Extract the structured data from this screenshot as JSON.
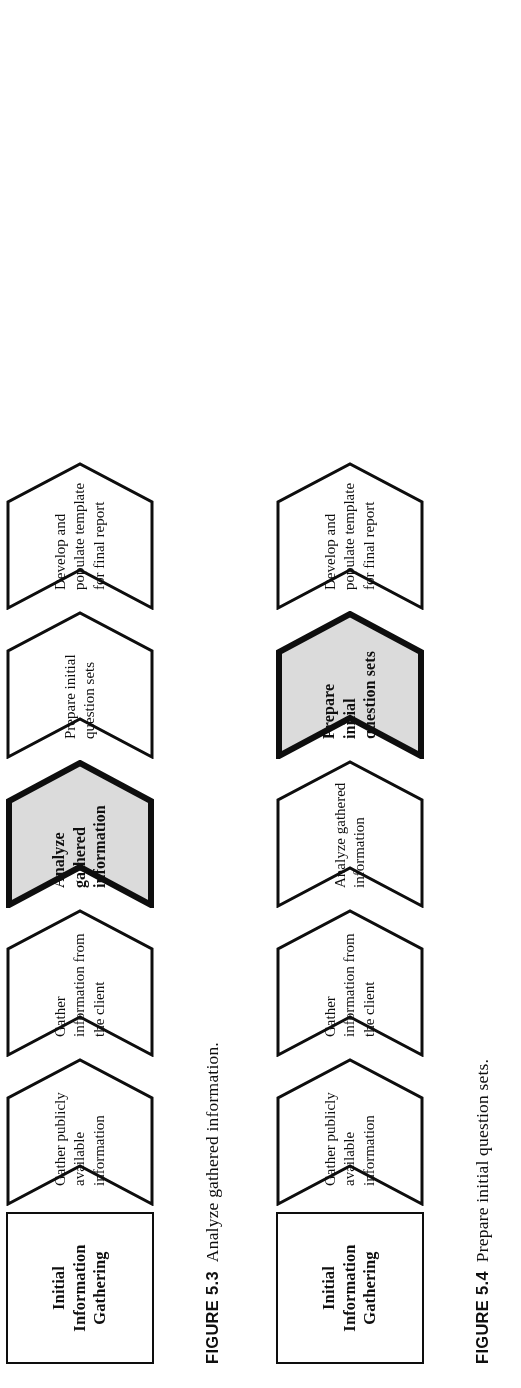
{
  "page": {
    "background": "#fdfdfd",
    "ink": "#101010",
    "highlight_fill": "#d9d9d9"
  },
  "figures": [
    {
      "id": "figure-5-3",
      "caption_label": "FIGURE 5.3",
      "caption_text": "Analyze gathered information.",
      "start_box": "Initial\nInformation\nGathering",
      "start_box_line1": "Initial",
      "start_box_line2": "Information",
      "start_box_line3": "Gathering",
      "steps": [
        {
          "name": "gather-publicly-available-information",
          "line1": "Gather publicly",
          "line2": "available",
          "line3": "information",
          "highlighted": false
        },
        {
          "name": "gather-information-from-the-client",
          "line1": "Gather",
          "line2": "information from",
          "line3": "the client",
          "highlighted": false
        },
        {
          "name": "analyze-gathered-information",
          "line1": "Analyze",
          "line2": "gathered",
          "line3": "information",
          "highlighted": true
        },
        {
          "name": "prepare-initial-question-sets",
          "line1": "Prepare initial",
          "line2": "question sets",
          "line3": "",
          "highlighted": false
        },
        {
          "name": "develop-and-populate-template-for-final-report",
          "line1": "Develop and",
          "line2": "populate template",
          "line3": "for final report",
          "highlighted": false
        }
      ]
    },
    {
      "id": "figure-5-4",
      "caption_label": "FIGURE 5.4",
      "caption_text": "Prepare initial question sets.",
      "start_box": "Initial\nInformation\nGathering",
      "start_box_line1": "Initial",
      "start_box_line2": "Information",
      "start_box_line3": "Gathering",
      "steps": [
        {
          "name": "gather-publicly-available-information",
          "line1": "Gather publicly",
          "line2": "available",
          "line3": "information",
          "highlighted": false
        },
        {
          "name": "gather-information-from-the-client",
          "line1": "Gather",
          "line2": "information from",
          "line3": "the client",
          "highlighted": false
        },
        {
          "name": "analyze-gathered-information",
          "line1": "Analyze gathered",
          "line2": "information",
          "line3": "",
          "highlighted": false
        },
        {
          "name": "prepare-initial-question-sets",
          "line1": "Prepare",
          "line2": "initial",
          "line3": "question sets",
          "highlighted": true
        },
        {
          "name": "develop-and-populate-template-for-final-report",
          "line1": "Develop and",
          "line2": "populate template",
          "line3": "for final report",
          "highlighted": false
        }
      ]
    }
  ]
}
